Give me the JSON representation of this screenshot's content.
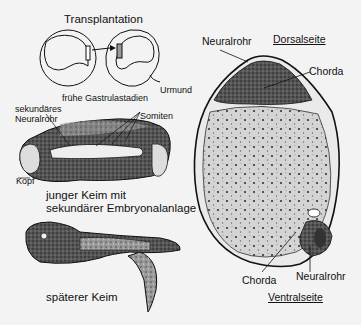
{
  "left_panel": {
    "transplant": {
      "title": "Transplantation",
      "urmund_label": "Urmund",
      "caption": "frühe Gastrulastadien"
    },
    "young_embryo": {
      "label_secondary_neural_tube_line1": "sekundäres",
      "label_secondary_neural_tube_line2": "Neuralrohr",
      "label_somites": "Somiten",
      "label_head": "Kopf",
      "caption_line1": "junger Keim mit",
      "caption_line2": "sekundärer Embryonalanlage"
    },
    "later_embryo": {
      "caption": "späterer Keim"
    }
  },
  "right_panel": {
    "cross_section": {
      "top_neural_tube": "Neuralrohr",
      "dorsal_side": "Dorsalseite",
      "top_chorda": "Chorda",
      "bottom_chorda": "Chorda",
      "bottom_neural_tube": "Neuralrohr",
      "ventral_side": "Ventralseite"
    }
  },
  "colors": {
    "background": "#f3f3f3",
    "ink": "#111111",
    "tissue_fill": "#cfcfcf"
  }
}
